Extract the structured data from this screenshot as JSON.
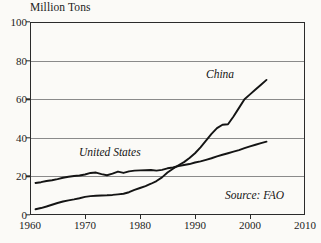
{
  "chart_data": {
    "type": "line",
    "title": "",
    "ylabel": "Million Tons",
    "xlabel": "",
    "xlim": [
      1960,
      2010
    ],
    "ylim": [
      0,
      100
    ],
    "grid": true,
    "legend_position": "inline-annotation",
    "y_ticks": [
      "0",
      "20",
      "40",
      "60",
      "80",
      "100"
    ],
    "y_tick_values": [
      0,
      20,
      40,
      60,
      80,
      100
    ],
    "x_ticks": [
      "1960",
      "1970",
      "1980",
      "1990",
      "2000",
      "2010"
    ],
    "x_tick_values": [
      1960,
      1970,
      1980,
      1990,
      2000,
      2010
    ],
    "annotations": [
      {
        "text": "China",
        "style": "italic"
      },
      {
        "text": "United States",
        "style": "italic"
      },
      {
        "text": "Source: FAO",
        "style": "italic"
      }
    ],
    "source": "Source: FAO",
    "series": [
      {
        "name": "China",
        "label": "China",
        "color": "#141414",
        "x": [
          1961,
          1962,
          1963,
          1964,
          1965,
          1966,
          1967,
          1968,
          1969,
          1970,
          1971,
          1972,
          1973,
          1974,
          1975,
          1976,
          1977,
          1978,
          1979,
          1980,
          1981,
          1982,
          1983,
          1984,
          1985,
          1986,
          1987,
          1988,
          1989,
          1990,
          1991,
          1992,
          1993,
          1994,
          1995,
          1996,
          1997,
          1998,
          1999,
          2000,
          2001,
          2002,
          2003
        ],
        "values": [
          3.0,
          3.6,
          4.4,
          5.3,
          6.2,
          7.0,
          7.6,
          8.1,
          8.7,
          9.4,
          9.8,
          10.0,
          10.1,
          10.2,
          10.4,
          10.7,
          11.0,
          11.8,
          13.0,
          14.0,
          15.0,
          16.2,
          17.6,
          19.5,
          22.0,
          24.0,
          25.8,
          27.4,
          29.5,
          32.0,
          35.0,
          38.5,
          42.0,
          45.0,
          46.8,
          47.0,
          51.0,
          55.5,
          60.0,
          62.5,
          65.0,
          67.5,
          70.0
        ]
      },
      {
        "name": "United States",
        "label": "United States",
        "color": "#141414",
        "x": [
          1961,
          1962,
          1963,
          1964,
          1965,
          1966,
          1967,
          1968,
          1969,
          1970,
          1971,
          1972,
          1973,
          1974,
          1975,
          1976,
          1977,
          1978,
          1979,
          1980,
          1981,
          1982,
          1983,
          1984,
          1985,
          1986,
          1987,
          1988,
          1989,
          1990,
          1991,
          1992,
          1993,
          1994,
          1995,
          1996,
          1997,
          1998,
          1999,
          2000,
          2001,
          2002,
          2003
        ],
        "values": [
          16.6,
          17.0,
          17.6,
          18.0,
          18.6,
          19.3,
          19.8,
          20.2,
          20.5,
          21.0,
          21.8,
          22.0,
          21.2,
          20.6,
          21.4,
          22.5,
          21.8,
          22.6,
          23.0,
          23.1,
          23.2,
          23.3,
          23.0,
          23.4,
          24.2,
          24.6,
          25.4,
          25.9,
          26.4,
          27.2,
          27.8,
          28.6,
          29.4,
          30.4,
          31.2,
          32.0,
          32.8,
          33.6,
          34.6,
          35.6,
          36.4,
          37.2,
          38.0
        ]
      }
    ]
  }
}
